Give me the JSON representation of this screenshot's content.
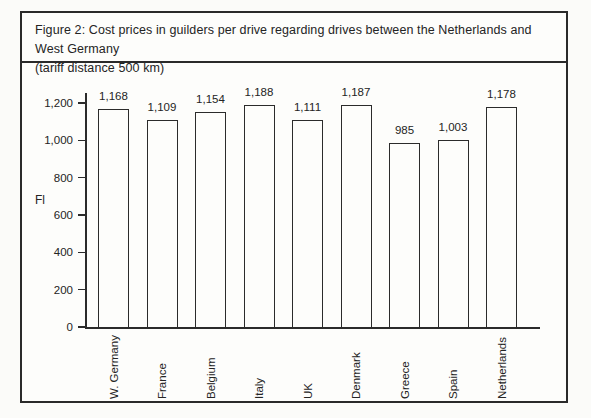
{
  "figure": {
    "title_lines": [
      "Figure 2: Cost prices in guilders per drive regarding drives between the Netherlands and West Germany",
      "(tariff distance 500 km)"
    ]
  },
  "chart_data": {
    "type": "bar",
    "title": "Figure 2: Cost prices in guilders per drive regarding drives between the Netherlands and West Germany (tariff distance 500 km)",
    "xlabel": "",
    "ylabel": "Fl",
    "categories": [
      "W. Germany",
      "France",
      "Belgium",
      "Italy",
      "UK",
      "Denmark",
      "Greece",
      "Spain",
      "Netherlands"
    ],
    "values": [
      1168,
      1109,
      1154,
      1188,
      1111,
      1187,
      985,
      1003,
      1178
    ],
    "value_labels": [
      "1,168",
      "1,109",
      "1,154",
      "1,188",
      "1,111",
      "1,187",
      "985",
      "1,003",
      "1,178"
    ],
    "ylim": [
      0,
      1200
    ],
    "y_tick_values": [
      0,
      200,
      400,
      600,
      800,
      1000,
      1200
    ],
    "y_tick_labels": [
      "0",
      "200",
      "400",
      "600",
      "800",
      "1,000",
      "1,200"
    ],
    "grid": false,
    "legend": "none",
    "bar_fill": "#fdfdfb",
    "bar_border": "#2b2b2b",
    "axis_color": "#2b2b2b",
    "text_color": "#242424"
  }
}
